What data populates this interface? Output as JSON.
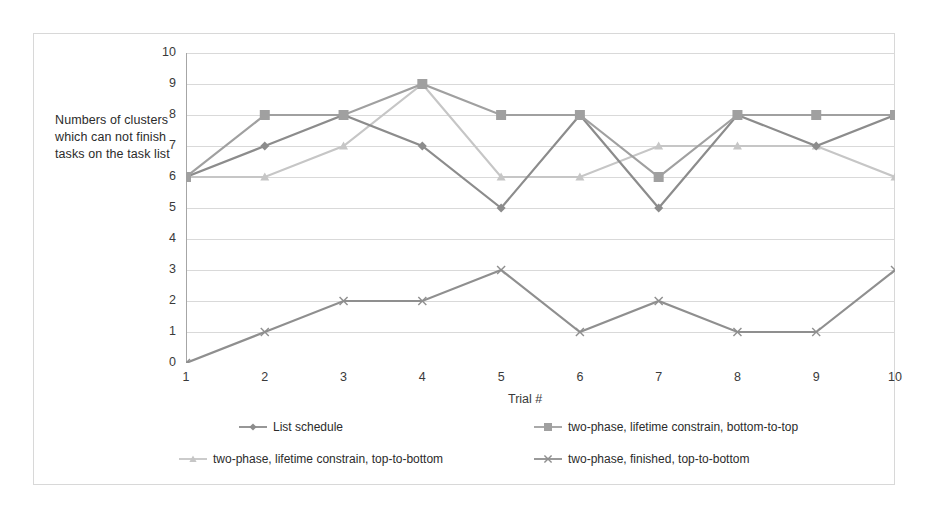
{
  "chart_data": {
    "type": "line",
    "title": "",
    "xlabel": "Trial #",
    "ylabel": "Numbers of clusters which can not finish tasks on the task list",
    "categories": [
      "1",
      "2",
      "3",
      "4",
      "5",
      "6",
      "7",
      "8",
      "9",
      "10"
    ],
    "x": [
      1,
      2,
      3,
      4,
      5,
      6,
      7,
      8,
      9,
      10
    ],
    "ylim": [
      0,
      10
    ],
    "xlim": [
      1,
      10
    ],
    "ytick_labels": [
      "0",
      "1",
      "2",
      "3",
      "4",
      "5",
      "6",
      "7",
      "8",
      "9",
      "10"
    ],
    "ytick_values": [
      0,
      1,
      2,
      3,
      4,
      5,
      6,
      7,
      8,
      9,
      10
    ],
    "grid": true,
    "grid_axis": "y",
    "legend_position": "bottom",
    "series": [
      {
        "name": "List schedule",
        "marker": "diamond",
        "color": "#8c8c8c",
        "values": [
          6,
          7,
          8,
          7,
          5,
          8,
          5,
          8,
          7,
          8
        ]
      },
      {
        "name": "two-phase, lifetime constrain, bottom-to-top",
        "marker": "square",
        "color": "#a0a0a0",
        "values": [
          6,
          8,
          8,
          9,
          8,
          8,
          6,
          8,
          8,
          8
        ]
      },
      {
        "name": "two-phase, lifetime constrain, top-to-bottom",
        "marker": "triangle",
        "color": "#c6c6c6",
        "values": [
          6,
          6,
          7,
          9,
          6,
          6,
          7,
          7,
          7,
          6
        ]
      },
      {
        "name": "two-phase, finished, top-to-bottom",
        "marker": "x",
        "color": "#8f8f8f",
        "values": [
          0,
          1,
          2,
          2,
          3,
          1,
          2,
          1,
          1,
          3
        ]
      }
    ]
  },
  "axis": {
    "y_label_text": "Numbers of clusters which can not finish tasks on the task list",
    "x_label_text": "Trial #"
  },
  "style": {
    "frame_border_color": "#d8d8d8",
    "gridline_color": "#d9d9d9",
    "axis_color": "#a6a6a6",
    "background": "#ffffff",
    "text_color": "#2b2b2b"
  }
}
